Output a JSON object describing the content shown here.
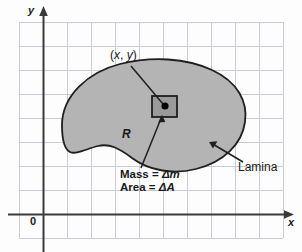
{
  "figure": {
    "axes": {
      "y_label": "y",
      "x_label": "x",
      "origin_label": "0"
    },
    "labels": {
      "region": "R",
      "point": "(x, y)",
      "point_x": "x",
      "point_y": "y",
      "lamina": "Lamina",
      "mass_line": "Mass = Δm",
      "area_line": "Area = ΔA",
      "mass_text": "Mass = ",
      "mass_symbol": "Δm",
      "area_text": "Area = ",
      "area_symbol": "ΔA"
    },
    "colors": {
      "background": "#fdfdfd",
      "grid": "#c8ccd4",
      "axis": "#3a3a3a",
      "lamina_fill": "#b4b4b4",
      "lamina_stroke": "#1f1f1f",
      "element_fill": "#9a9a9a",
      "element_stroke": "#1f1f1f",
      "point_dot": "#000000",
      "leader": "#1f1f1f",
      "text": "#1a1a1a"
    },
    "grid": {
      "left": 19,
      "top": 22,
      "right": 283,
      "bottom": 238,
      "cell_size": 24,
      "columns": 11,
      "rows": 9
    },
    "axis_positions": {
      "y_axis_x": 43,
      "x_axis_y": 214
    },
    "element_rect": {
      "x": 152,
      "y": 96,
      "width": 25,
      "height": 21
    },
    "point_dot": {
      "cx": 165,
      "cy": 106,
      "r": 3.6
    }
  }
}
